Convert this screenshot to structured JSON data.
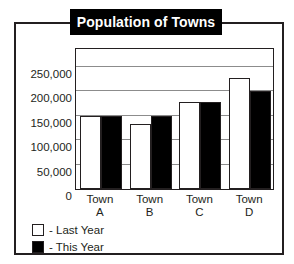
{
  "chart_data": {
    "type": "bar",
    "title": "Population of Towns",
    "xlabel": "",
    "ylabel": "",
    "categories": [
      "Town A",
      "Town B",
      "Town C",
      "Town D"
    ],
    "category_lines": [
      [
        "Town",
        "A"
      ],
      [
        "Town",
        "B"
      ],
      [
        "Town",
        "C"
      ],
      [
        "Town",
        "D"
      ]
    ],
    "series": [
      {
        "name": "- Last Year",
        "color": "#ffffff",
        "values": [
          150000,
          132000,
          177000,
          227000
        ]
      },
      {
        "name": "- This Year",
        "color": "#000000",
        "values": [
          150000,
          150000,
          177000,
          201000
        ]
      }
    ],
    "ylim": [
      0,
      290000
    ],
    "yticks": [
      0,
      50000,
      100000,
      150000,
      200000,
      250000
    ],
    "ytick_labels": [
      "0",
      "50,000",
      "100,000",
      "150,000",
      "200,000",
      "250,000"
    ],
    "grid": true,
    "legend_position": "below-left"
  },
  "legend": {
    "items": [
      {
        "label": "- Last Year",
        "swatch": "white-square-icon"
      },
      {
        "label": "- This Year",
        "swatch": "black-square-icon"
      }
    ]
  }
}
